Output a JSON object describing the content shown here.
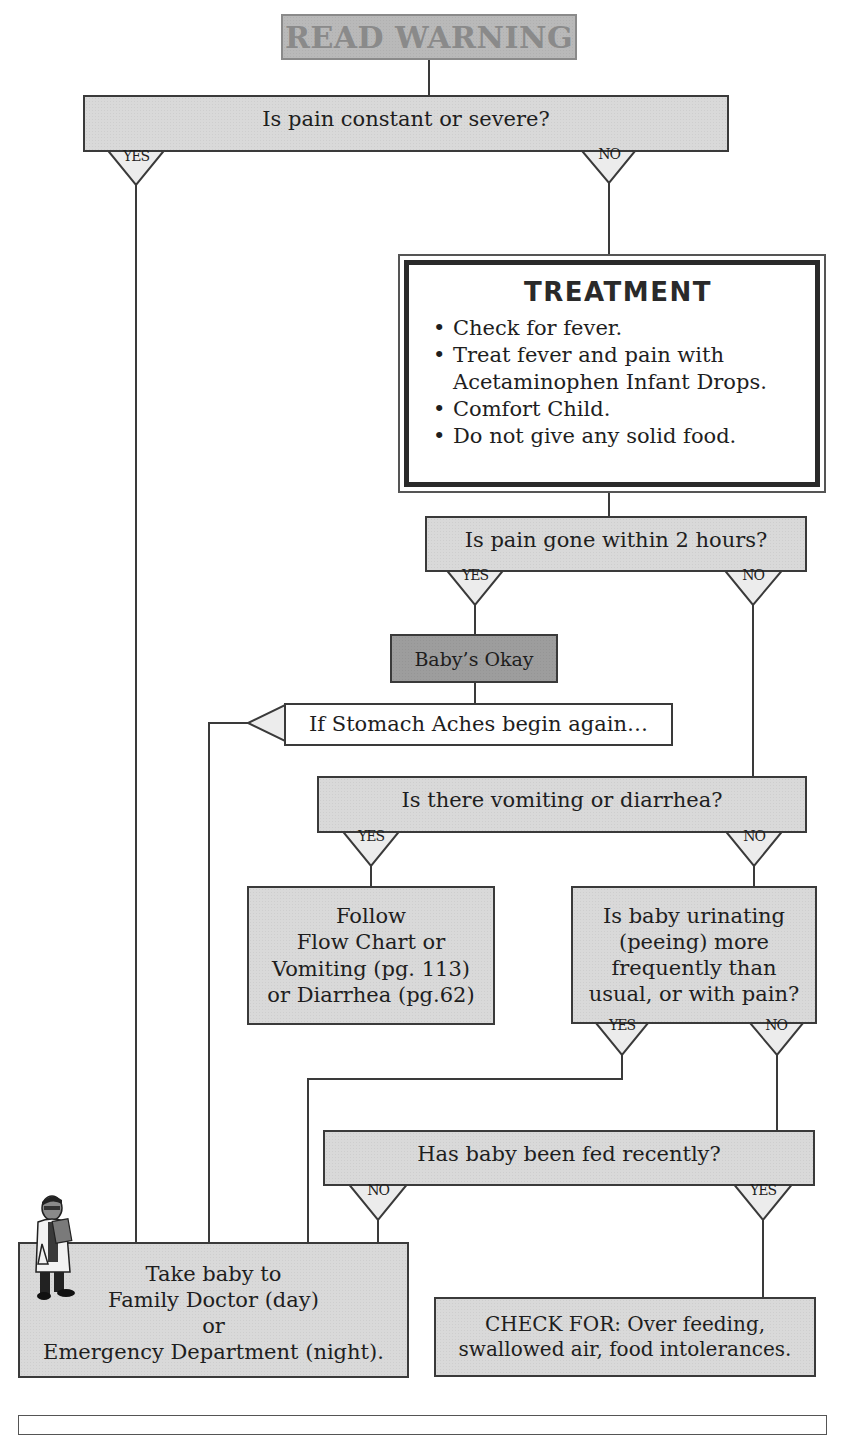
{
  "title_box": {
    "label": "READ WARNING"
  },
  "nodes": {
    "q_pain_constant": {
      "label": "Is pain constant or severe?"
    },
    "treatment": {
      "title": "TREATMENT",
      "items": [
        "Check for fever.",
        "Treat fever and pain with Acetaminophen Infant Drops.",
        "Comfort Child.",
        "Do not give any solid food."
      ]
    },
    "q_pain_gone": {
      "label": "Is pain gone within 2 hours?"
    },
    "babys_okay": {
      "label": "Baby’s  Okay"
    },
    "stomach_aches_again": {
      "label": "If Stomach Aches begin again…"
    },
    "q_vomiting": {
      "label": "Is there vomiting or diarrhea?"
    },
    "follow_flowchart": {
      "lines": [
        "Follow",
        "Flow Chart or",
        "Vomiting (pg. 113)",
        "or Diarrhea (pg.62)"
      ]
    },
    "q_urinating": {
      "lines": [
        "Is baby urinating",
        "(peeing) more",
        "frequently than",
        "usual, or with pain?"
      ]
    },
    "q_fed_recently": {
      "label": "Has baby been fed recently?"
    },
    "take_to_doctor": {
      "lines": [
        "Take baby to",
        "Family Doctor (day)",
        "or",
        "Emergency Department (night)."
      ]
    },
    "check_for": {
      "lines": [
        "CHECK FOR: Over feeding,",
        "swallowed air, food intolerances."
      ]
    }
  },
  "branch_labels": {
    "pain_constant_yes": "YES",
    "pain_constant_no": "NO",
    "pain_gone_yes": "YES",
    "pain_gone_no": "NO",
    "vomiting_yes": "YES",
    "vomiting_no": "NO",
    "urinating_yes": "YES",
    "urinating_no": "NO",
    "fed_no": "NO",
    "fed_yes": "YES"
  },
  "icons": {
    "doctor": "doctor-illustration-icon"
  },
  "colors": {
    "box_fill": "#d9d9d9",
    "warning_fill": "#b9b9b9",
    "warning_text": "#8a8a8a",
    "okay_fill": "#9d9d9d",
    "line": "#3a3a3a"
  }
}
